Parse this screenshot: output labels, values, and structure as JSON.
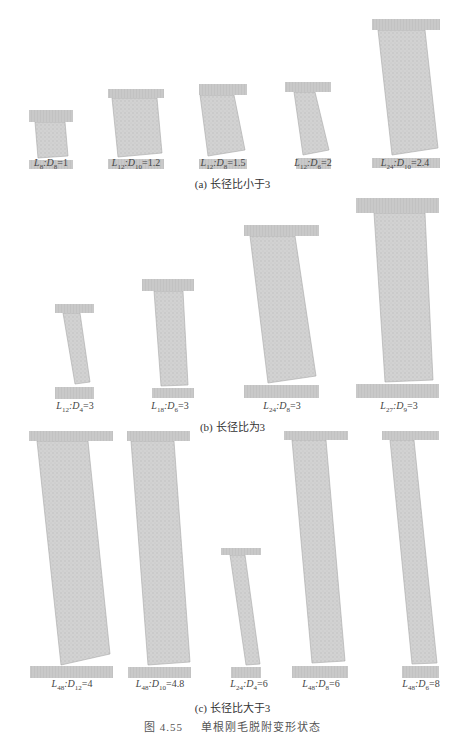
{
  "figure": {
    "number": "图 4.55",
    "title": "单根刚毛脱附变形状态",
    "colors": {
      "plate": "#c8c8c8",
      "specimen": "#cfcfcf",
      "specimen_edge": "#a8a8a8",
      "text": "#444444"
    }
  },
  "panels": [
    {
      "caption": "(a) 长径比小于3",
      "specimens": [
        {
          "L": "8",
          "D": "8",
          "ratio": "1"
        },
        {
          "L": "12",
          "D": "10",
          "ratio": "1.2"
        },
        {
          "L": "12",
          "D": "8",
          "ratio": "1.5"
        },
        {
          "L": "12",
          "D": "6",
          "ratio": "2"
        },
        {
          "L": "24",
          "D": "10",
          "ratio": "2.4"
        }
      ]
    },
    {
      "caption": "(b) 长径比为3",
      "specimens": [
        {
          "L": "12",
          "D": "4",
          "ratio": "3"
        },
        {
          "L": "18",
          "D": "6",
          "ratio": "3"
        },
        {
          "L": "24",
          "D": "8",
          "ratio": "3"
        },
        {
          "L": "27",
          "D": "9",
          "ratio": "3"
        }
      ]
    },
    {
      "caption": "(c) 长径比大于3",
      "specimens": [
        {
          "L": "48",
          "D": "12",
          "ratio": "4"
        },
        {
          "L": "48",
          "D": "10",
          "ratio": "4.8"
        },
        {
          "L": "24",
          "D": "4",
          "ratio": "6"
        },
        {
          "L": "48",
          "D": "8",
          "ratio": "6"
        },
        {
          "L": "48",
          "D": "6",
          "ratio": "8"
        }
      ]
    }
  ]
}
